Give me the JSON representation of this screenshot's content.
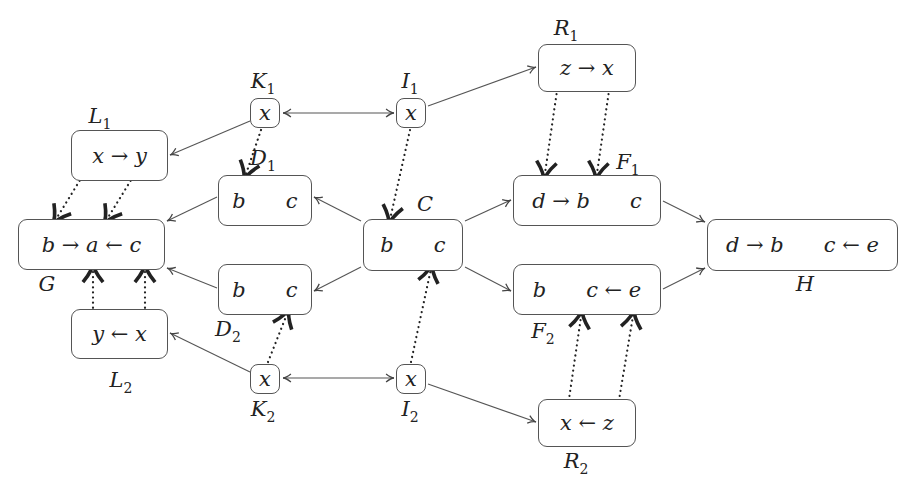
{
  "diagram": {
    "type": "graph-rewriting-pushout-diagram",
    "nodes": [
      {
        "id": "L1",
        "name": "L",
        "sub": "1",
        "content": "x → y",
        "box": [
          71,
          130,
          97,
          51
        ],
        "label_pos": [
          100,
          118
        ]
      },
      {
        "id": "G",
        "name": "G",
        "sub": "",
        "content": "b → a ← c",
        "box": [
          18,
          219,
          147,
          51
        ],
        "label_pos": [
          47,
          286
        ]
      },
      {
        "id": "L2",
        "name": "L",
        "sub": "2",
        "content": "y ← x",
        "box": [
          71,
          309,
          97,
          50
        ],
        "label_pos": [
          121,
          382
        ]
      },
      {
        "id": "D1",
        "name": "D",
        "sub": "1",
        "content": "b      c",
        "box": [
          218,
          175,
          94,
          51
        ],
        "label_pos": [
          263,
          160
        ]
      },
      {
        "id": "D2",
        "name": "D",
        "sub": "2",
        "content": "b      c",
        "box": [
          218,
          264,
          94,
          51
        ],
        "label_pos": [
          228,
          331
        ]
      },
      {
        "id": "K1",
        "name": "K",
        "sub": "1",
        "content": "x",
        "box": [
          250,
          98,
          30,
          30
        ],
        "label_pos": [
          263,
          83
        ],
        "small": true
      },
      {
        "id": "K2",
        "name": "K",
        "sub": "2",
        "content": "x",
        "box": [
          250,
          364,
          30,
          30
        ],
        "label_pos": [
          263,
          411
        ],
        "small": true
      },
      {
        "id": "I1",
        "name": "I",
        "sub": "1",
        "content": "x",
        "box": [
          396,
          98,
          30,
          30
        ],
        "label_pos": [
          410,
          83
        ],
        "small": true
      },
      {
        "id": "I2",
        "name": "I",
        "sub": "2",
        "content": "x",
        "box": [
          396,
          364,
          30,
          30
        ],
        "label_pos": [
          410,
          411
        ],
        "small": true
      },
      {
        "id": "C",
        "name": "C",
        "sub": "",
        "content": "b      c",
        "box": [
          363,
          219,
          100,
          52
        ],
        "label_pos": [
          425,
          206
        ]
      },
      {
        "id": "R1",
        "name": "R",
        "sub": "1",
        "content": "z → x",
        "box": [
          538,
          44,
          98,
          48
        ],
        "label_pos": [
          566,
          30
        ]
      },
      {
        "id": "F1",
        "name": "F",
        "sub": "1",
        "content": "d → b      c",
        "box": [
          513,
          175,
          148,
          51
        ],
        "label_pos": [
          628,
          164
        ]
      },
      {
        "id": "F2",
        "name": "F",
        "sub": "2",
        "content": "b      c ← e",
        "box": [
          513,
          264,
          148,
          51
        ],
        "label_pos": [
          543,
          333
        ]
      },
      {
        "id": "R2",
        "name": "R",
        "sub": "2",
        "content": "x ← z",
        "box": [
          538,
          399,
          98,
          48
        ],
        "label_pos": [
          576,
          463
        ]
      },
      {
        "id": "H",
        "name": "H",
        "sub": "",
        "content": "d → b      c ← e",
        "box": [
          707,
          219,
          191,
          52
        ],
        "label_pos": [
          805,
          286
        ]
      }
    ],
    "arrows": [
      {
        "from": "K1",
        "to": "L1",
        "style": "solid"
      },
      {
        "from": "K1",
        "to": "D1",
        "style": "dotted"
      },
      {
        "from": "I1",
        "to": "K1",
        "style": "solid"
      },
      {
        "from": "I1",
        "to": "R1",
        "style": "solid"
      },
      {
        "from": "I1",
        "to": "C",
        "style": "dotted"
      },
      {
        "from": "L1",
        "to": "G",
        "style": "dotted"
      },
      {
        "from": "D1",
        "to": "G",
        "style": "solid"
      },
      {
        "from": "D2",
        "to": "G",
        "style": "solid"
      },
      {
        "from": "C",
        "to": "D1",
        "style": "solid"
      },
      {
        "from": "C",
        "to": "D2",
        "style": "solid"
      },
      {
        "from": "C",
        "to": "F1",
        "style": "solid"
      },
      {
        "from": "C",
        "to": "F2",
        "style": "solid"
      },
      {
        "from": "R1",
        "to": "F1",
        "style": "dotted"
      },
      {
        "from": "F1",
        "to": "H",
        "style": "solid"
      },
      {
        "from": "F2",
        "to": "H",
        "style": "solid"
      },
      {
        "from": "L2",
        "to": "G",
        "style": "dotted"
      },
      {
        "from": "K2",
        "to": "L2",
        "style": "solid"
      },
      {
        "from": "K2",
        "to": "D2",
        "style": "dotted"
      },
      {
        "from": "I2",
        "to": "K2",
        "style": "solid"
      },
      {
        "from": "I2",
        "to": "R2",
        "style": "solid"
      },
      {
        "from": "I2",
        "to": "C",
        "style": "dotted"
      },
      {
        "from": "R2",
        "to": "F2",
        "style": "dotted"
      }
    ]
  }
}
